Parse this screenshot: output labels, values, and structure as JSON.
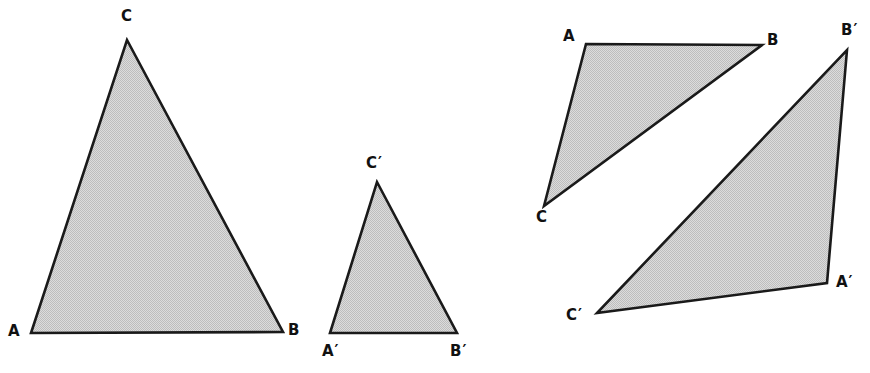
{
  "figure": {
    "background_color": "#ffffff",
    "fill_color": "#d2d2d2",
    "stroke_color": "#1a1a1a",
    "width": 870,
    "height": 373
  },
  "groups": [
    {
      "name": "left-pair",
      "description": "A large triangle ABC and a smaller similar triangle A'B'C' side by side",
      "triangles": [
        {
          "id": "triangle-abc-left",
          "labels": [
            "A",
            "B",
            "C"
          ],
          "points": "31,333 283,332 127,40",
          "vertices": [
            {
              "label": "A",
              "x": 31,
              "y": 333,
              "label_x": 8,
              "label_y": 327
            },
            {
              "label": "B",
              "x": 283,
              "y": 332,
              "label_x": 288,
              "label_y": 326
            },
            {
              "label": "C",
              "x": 127,
              "y": 40,
              "label_x": 120,
              "label_y": 10
            }
          ]
        },
        {
          "id": "triangle-abc-prime-left",
          "labels": [
            "A'",
            "B'",
            "C'"
          ],
          "points": "330,333 457,333 377,182",
          "vertices": [
            {
              "label": "A′",
              "x": 330,
              "y": 333,
              "label_x": 322,
              "label_y": 345
            },
            {
              "label": "B′",
              "x": 457,
              "y": 333,
              "label_x": 450,
              "label_y": 345
            },
            {
              "label": "C′",
              "x": 377,
              "y": 182,
              "label_x": 366,
              "label_y": 157
            }
          ]
        }
      ]
    },
    {
      "name": "right-pair",
      "description": "An obtuse triangle ABC and a larger rotated similar triangle A'B'C'",
      "triangles": [
        {
          "id": "triangle-abc-right",
          "labels": [
            "A",
            "B",
            "C"
          ],
          "points": "586,44 762,45 544,206",
          "vertices": [
            {
              "label": "A",
              "x": 586,
              "y": 44,
              "label_x": 564,
              "label_y": 30
            },
            {
              "label": "B",
              "x": 762,
              "y": 45,
              "label_x": 767,
              "label_y": 34
            },
            {
              "label": "C",
              "x": 544,
              "y": 206,
              "label_x": 536,
              "label_y": 211
            }
          ]
        },
        {
          "id": "triangle-abc-prime-right",
          "labels": [
            "A'",
            "B'",
            "C'"
          ],
          "points": "847,50 827,283 597,313",
          "vertices": [
            {
              "label": "A′",
              "x": 827,
              "y": 283,
              "label_x": 836,
              "label_y": 276
            },
            {
              "label": "B′",
              "x": 847,
              "y": 50,
              "label_x": 842,
              "label_y": 24
            },
            {
              "label": "C′",
              "x": 597,
              "y": 313,
              "label_x": 567,
              "label_y": 309
            }
          ]
        }
      ]
    }
  ],
  "labels": {
    "l1_a": "A",
    "l1_b": "B",
    "l1_c": "C",
    "l2_a": "A′",
    "l2_b": "B′",
    "l2_c": "C′",
    "r1_a": "A",
    "r1_b": "B",
    "r1_c": "C",
    "r2_a": "A′",
    "r2_b": "B′",
    "r2_c": "C′"
  },
  "polygons": {
    "left_big": "31,333 283,332 127,40",
    "left_small": "330,333 457,333 377,182",
    "right_upper": "586,44 762,45 544,206",
    "right_lower": "847,50 827,283 597,313"
  }
}
